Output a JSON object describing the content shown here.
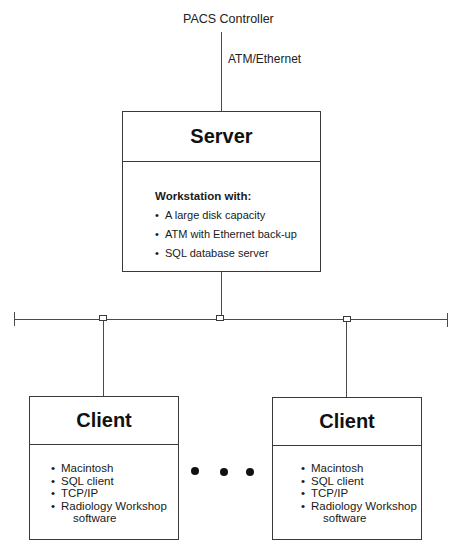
{
  "top": {
    "controller_label": "PACS Controller",
    "link_label": "ATM/Ethernet"
  },
  "server": {
    "title": "Server",
    "subtitle": "Workstation with:",
    "items": [
      "A large disk capacity",
      "ATM with Ethernet back-up",
      "SQL database server"
    ]
  },
  "network": {
    "connectors": 3,
    "ellipsis": "• • •"
  },
  "clients": [
    {
      "title": "Client",
      "items": [
        "Macintosh",
        "SQL client",
        "TCP/IP",
        "Radiology Workshop"
      ],
      "item_continuation": "software"
    },
    {
      "title": "Client",
      "items": [
        "Macintosh",
        "SQL client",
        "TCP/IP",
        "Radiology Workshop"
      ],
      "item_continuation": "software"
    }
  ],
  "colors": {
    "line": "#4a4a4a",
    "text": "#1a1a1a",
    "background": "#ffffff"
  }
}
